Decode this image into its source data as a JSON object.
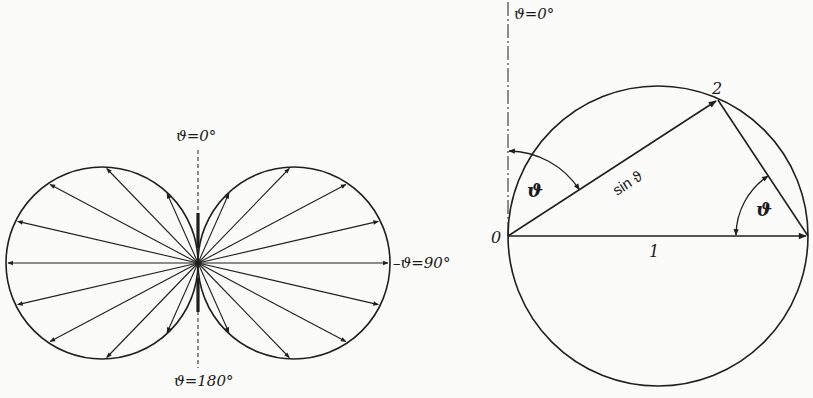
{
  "figures": [
    {
      "id": "polar-pattern",
      "description": "Polar radiation pattern of a dipole: two circles tangent at origin, arrows of length proportional to sin(theta)",
      "labels": {
        "top": "ϑ=0°",
        "bottom": "ϑ=180°",
        "right": "–ϑ=90°"
      },
      "geometry": {
        "origin": [
          198,
          263
        ],
        "lobe_radius": 96,
        "arrow_angles_deg_from_vertical": [
          24,
          44,
          62,
          77,
          90
        ]
      }
    },
    {
      "id": "geometric-construction",
      "description": "Circle with diameter 0–1 of length 1; chord 0–2 equals sin ϑ; angles ϑ marked at point 0 and at right end",
      "labels": {
        "top": "ϑ=0°",
        "point_0": "0",
        "point_2": "2",
        "chord_label": "sin ϑ",
        "diameter_label": "1",
        "angle_left": "ϑ",
        "angle_right": "ϑ"
      },
      "geometry": {
        "center": [
          658,
          236
        ],
        "radius": 150,
        "point_0": [
          508,
          236
        ],
        "point_1": [
          808,
          236
        ],
        "point_2": [
          718,
          100
        ]
      }
    }
  ],
  "colors": {
    "ink": "#1f1f1f",
    "paper": "#fbfbf9"
  }
}
